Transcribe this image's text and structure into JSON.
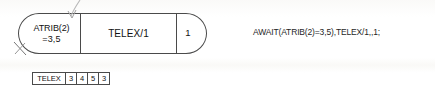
{
  "diagram": {
    "await_node": {
      "name": "AWAIT node",
      "attribute_condition": {
        "line_1": "ATRIB(2)",
        "line_2": "=3,5"
      },
      "file_label": "TELEX/1",
      "capacity": "1"
    },
    "statement": "AWAIT(ATRIB(2)=3,5),TELEX/1,,1;",
    "file_table": {
      "label": "TELEX",
      "entries": [
        "3",
        "4",
        "5",
        "3"
      ]
    }
  },
  "colors": {
    "ink": "#4a4a4a",
    "text": "#111111",
    "paper": "#ffffff"
  }
}
